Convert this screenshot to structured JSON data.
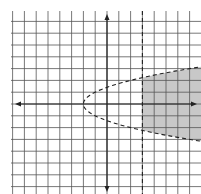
{
  "chart_data": {
    "type": "line",
    "title": "",
    "xlabel": "",
    "ylabel": "",
    "grid": true,
    "grid_spacing_units": 1,
    "xlim": [
      -8.1,
      8.2
    ],
    "ylim": [
      -7.7,
      7.9
    ],
    "axes_arrows": true,
    "series": [
      {
        "name": "boundary parabola",
        "equation": "x = y^2 - 2",
        "style": "dashed",
        "vertex": [
          -2,
          0
        ]
      },
      {
        "name": "boundary vertical line",
        "equation": "x = 3",
        "style": "dashed"
      }
    ],
    "shaded_region": {
      "description": "region right of x = 3 and inside parabola x > y^2 - 2",
      "inequalities": [
        "x > y^2 - 2",
        "x > 3"
      ],
      "color": "#c8c8c8"
    }
  },
  "colors": {
    "grid": "#555555",
    "axis": "#222222",
    "shade": "#c8c8c8",
    "background": "#ffffff"
  }
}
